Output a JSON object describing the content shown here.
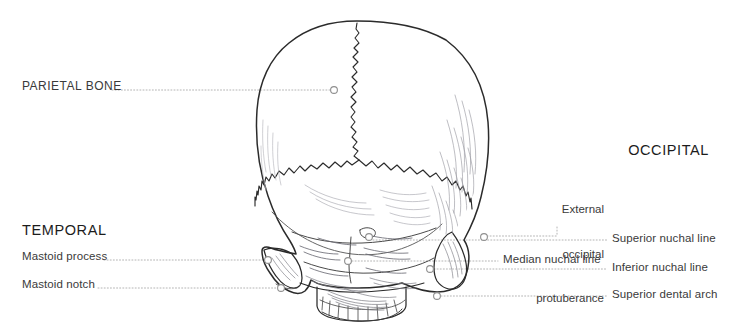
{
  "figure": {
    "view": "posterior",
    "stroke_color": "#2b2b2b",
    "shade_color": "#8d8d96",
    "leader_color": "#b0b0b0",
    "marker_color": "#9a9a9a",
    "background": "#ffffff"
  },
  "headings": [
    {
      "id": "parietal",
      "text": "PARIETAL BONE",
      "x": 22,
      "y": 85,
      "align": "left",
      "style": "sublabel-caps"
    },
    {
      "id": "temporal",
      "text": "TEMPORAL",
      "x": 22,
      "y": 231,
      "align": "left",
      "style": "heading"
    },
    {
      "id": "occipital",
      "text": "OCCIPITAL",
      "x": 709,
      "y": 151,
      "align": "right",
      "style": "heading"
    }
  ],
  "labels": [
    {
      "id": "parietal-bone",
      "text": "PARIETAL BONE",
      "side": "left",
      "x": 22,
      "y": 86,
      "leader": {
        "x1": 112,
        "y1": 90,
        "x2": 333,
        "y2": 90
      },
      "marker": {
        "cx": 334,
        "cy": 90,
        "r": 3.5
      }
    },
    {
      "id": "mastoid-process",
      "text": "Mastoid process",
      "side": "left",
      "x": 22,
      "y": 256,
      "leader": {
        "x1": 104,
        "y1": 260,
        "x2": 266,
        "y2": 260
      },
      "marker": {
        "cx": 268,
        "cy": 260,
        "r": 3.5
      }
    },
    {
      "id": "mastoid-notch",
      "text": "Mastoid notch",
      "side": "left",
      "x": 22,
      "y": 284,
      "leader": {
        "x1": 98,
        "y1": 288,
        "x2": 279,
        "y2": 288
      },
      "marker": {
        "cx": 281,
        "cy": 288,
        "r": 3.5
      }
    },
    {
      "id": "external-occipital-protuberance",
      "text": "External\noccipital\nprotuberance",
      "lines": [
        "External",
        "occipital",
        "protuberance"
      ],
      "side": "right-stacked",
      "x": 604,
      "y": 178,
      "leader": {
        "x1": 557,
        "y1": 228,
        "x2": 557,
        "y2": 236
      },
      "marker": {
        "cx": 369,
        "cy": 236,
        "r": 3.5
      }
    },
    {
      "id": "superior-nuchal-line",
      "text": "Superior nuchal line",
      "side": "right",
      "x": 612,
      "y": 236,
      "leader": {
        "x1": 372,
        "y1": 240,
        "x2": 606,
        "y2": 240
      },
      "marker": {
        "cx": 369,
        "cy": 236,
        "r": 3.5
      }
    },
    {
      "id": "median-nuchal-line",
      "text": "Median nuchal line",
      "side": "right-inner",
      "x": 503,
      "y": 257,
      "leader": {
        "x1": 351,
        "y1": 261,
        "x2": 497,
        "y2": 261
      },
      "marker": {
        "cx": 348,
        "cy": 261,
        "r": 3.5
      }
    },
    {
      "id": "inferior-nuchal-line",
      "text": "Inferior nuchal line",
      "side": "right",
      "x": 612,
      "y": 265,
      "leader": {
        "x1": 433,
        "y1": 269,
        "x2": 606,
        "y2": 269
      },
      "marker": {
        "cx": 430,
        "cy": 269,
        "r": 3.5
      }
    },
    {
      "id": "superior-dental-arch",
      "text": "Superior dental arch",
      "side": "right",
      "x": 612,
      "y": 292,
      "leader": {
        "x1": 440,
        "y1": 296,
        "x2": 606,
        "y2": 296
      },
      "marker": {
        "cx": 437,
        "cy": 296,
        "r": 3.5
      }
    }
  ],
  "anatomy_parts": [
    "cranium",
    "sagittal-suture",
    "lambdoid-suture",
    "occipital-bone",
    "parietal-bone",
    "temporal-bone",
    "mastoid-process",
    "mastoid-notch",
    "superior-nuchal-line",
    "median-nuchal-line",
    "inferior-nuchal-line",
    "external-occipital-protuberance",
    "superior-dental-arch"
  ]
}
